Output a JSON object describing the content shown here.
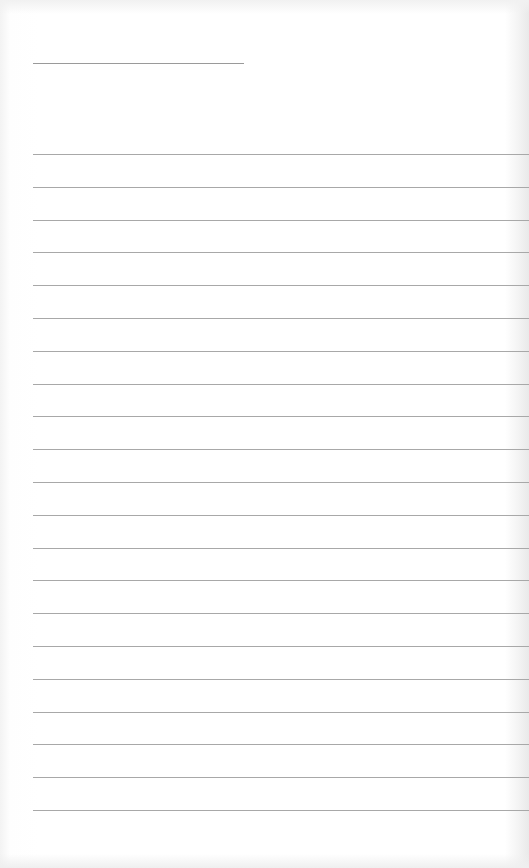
{
  "document": {
    "type": "lined-paper",
    "header_line": {
      "label": ""
    },
    "rule_count": 21,
    "rule_spacing_px": 32.8,
    "line_color": "#a8a8a8"
  }
}
